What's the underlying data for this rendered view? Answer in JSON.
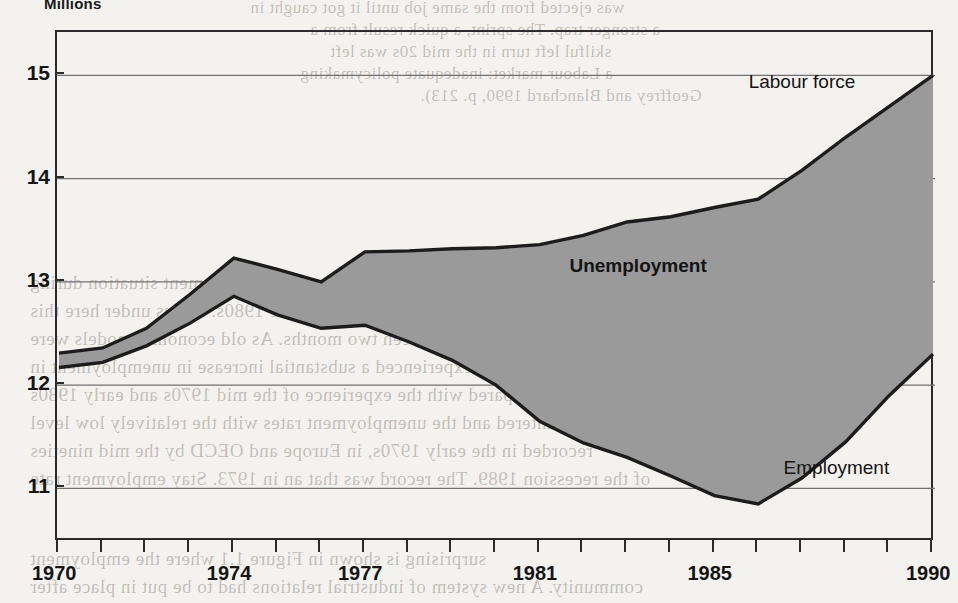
{
  "chart_data": {
    "type": "area",
    "title": "",
    "ylabel": "Millions",
    "xlabel": "",
    "ylim": [
      10.5,
      15.4
    ],
    "xlim": [
      1970,
      1990
    ],
    "grid": true,
    "y_ticks": [
      "11",
      "12",
      "13",
      "14",
      "15"
    ],
    "y_tick_values": [
      11,
      12,
      13,
      14,
      15
    ],
    "x_ticks": [
      "1970",
      "1974",
      "1977",
      "1981",
      "1985",
      "1990"
    ],
    "x_tick_values": [
      1970,
      1974,
      1977,
      1981,
      1985,
      1990
    ],
    "x_minor_ticks": [
      1970,
      1971,
      1972,
      1973,
      1974,
      1975,
      1976,
      1977,
      1978,
      1979,
      1980,
      1981,
      1982,
      1983,
      1984,
      1985,
      1986,
      1987,
      1988,
      1989,
      1990
    ],
    "x": [
      1970,
      1971,
      1972,
      1973,
      1974,
      1975,
      1976,
      1977,
      1978,
      1979,
      1980,
      1981,
      1982,
      1983,
      1984,
      1985,
      1986,
      1987,
      1988,
      1989,
      1990
    ],
    "series": [
      {
        "name": "Labour force",
        "values": [
          12.31,
          12.36,
          12.55,
          12.88,
          13.23,
          13.12,
          13.0,
          13.29,
          13.3,
          13.32,
          13.33,
          13.36,
          13.45,
          13.58,
          13.63,
          13.72,
          13.8,
          14.08,
          14.4,
          14.7,
          15.0
        ],
        "fill": "none",
        "line_color": "#1c1c1c"
      },
      {
        "name": "Employment",
        "values": [
          12.17,
          12.22,
          12.38,
          12.6,
          12.86,
          12.68,
          12.55,
          12.58,
          12.42,
          12.24,
          12.0,
          11.65,
          11.44,
          11.3,
          11.12,
          10.93,
          10.85,
          11.1,
          11.45,
          11.9,
          12.3
        ],
        "fill": "none",
        "line_color": "#1c1c1c"
      }
    ],
    "band": {
      "name": "Unemployment",
      "upper_series": "Labour force",
      "lower_series": "Employment",
      "fill_color": "#9a9a9a",
      "label": "Unemployment"
    },
    "annotations": [
      {
        "text": "Labour force",
        "x": 1987.2,
        "y": 14.92,
        "bold": false
      },
      {
        "text": "Unemployment",
        "x": 1983.1,
        "y": 13.13,
        "bold": true
      },
      {
        "text": "Employment",
        "x": 1988.0,
        "y": 11.18,
        "bold": false
      }
    ],
    "legend_position": "inline-annotations",
    "background_color": "#f4f2ee",
    "frame_color": "#2b2b2b",
    "gridline_color": "#707070"
  },
  "ghost_text": {
    "top_lines": [
      "was ejected from the same job until it got caught in",
      "a stronger trap. The sprint, a quick result from a",
      "skilful left turn in the mid 20s was left",
      "a Labour market: inadequate policymaking",
      "Geoffrey and Blanchard 1990, p. 213)."
    ],
    "mid_heading": "Introduction",
    "body_lines": [
      "The European unemployment situation during",
      "the 1970s and the 1980s. Let us under here this",
      "difference between two months. As old economic models were",
      "countries experienced a substantial increase in unemployment in",
      "compared with the experience of the mid 1970s and early 1980s",
      "countered and the unemployment rates with the relatively low level",
      "recorded in the early 1970s, in Europe and OECD by the mid nineties",
      "of the recession 1989. The record was that an in 1973. Stay employment rate",
      "surprising is shown in Figure 1.1 where the employment",
      "community. A new system of industrial relations had to be put in place after"
    ]
  }
}
